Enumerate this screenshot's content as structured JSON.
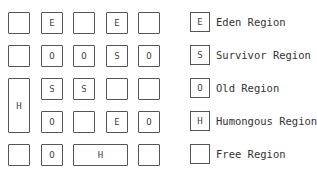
{
  "grid": {
    "cells": [
      {
        "row": 0,
        "col": 0,
        "span": 1,
        "rowspan": 1,
        "label": ""
      },
      {
        "row": 0,
        "col": 1,
        "span": 1,
        "rowspan": 1,
        "label": "E"
      },
      {
        "row": 0,
        "col": 2,
        "span": 1,
        "rowspan": 1,
        "label": ""
      },
      {
        "row": 0,
        "col": 3,
        "span": 1,
        "rowspan": 1,
        "label": "E"
      },
      {
        "row": 0,
        "col": 4,
        "span": 1,
        "rowspan": 1,
        "label": ""
      },
      {
        "row": 1,
        "col": 0,
        "span": 1,
        "rowspan": 1,
        "label": ""
      },
      {
        "row": 1,
        "col": 1,
        "span": 1,
        "rowspan": 1,
        "label": "O"
      },
      {
        "row": 1,
        "col": 2,
        "span": 1,
        "rowspan": 1,
        "label": "O"
      },
      {
        "row": 1,
        "col": 3,
        "span": 1,
        "rowspan": 1,
        "label": "S"
      },
      {
        "row": 1,
        "col": 4,
        "span": 1,
        "rowspan": 1,
        "label": "O"
      },
      {
        "row": 2,
        "col": 0,
        "span": 1,
        "rowspan": 2,
        "label": "H"
      },
      {
        "row": 2,
        "col": 1,
        "span": 1,
        "rowspan": 1,
        "label": "S"
      },
      {
        "row": 2,
        "col": 2,
        "span": 1,
        "rowspan": 1,
        "label": "S"
      },
      {
        "row": 2,
        "col": 3,
        "span": 1,
        "rowspan": 1,
        "label": ""
      },
      {
        "row": 2,
        "col": 4,
        "span": 1,
        "rowspan": 1,
        "label": ""
      },
      {
        "row": 3,
        "col": 1,
        "span": 1,
        "rowspan": 1,
        "label": "O"
      },
      {
        "row": 3,
        "col": 2,
        "span": 1,
        "rowspan": 1,
        "label": ""
      },
      {
        "row": 3,
        "col": 3,
        "span": 1,
        "rowspan": 1,
        "label": "E"
      },
      {
        "row": 3,
        "col": 4,
        "span": 1,
        "rowspan": 1,
        "label": "O"
      },
      {
        "row": 4,
        "col": 0,
        "span": 1,
        "rowspan": 1,
        "label": ""
      },
      {
        "row": 4,
        "col": 1,
        "span": 1,
        "rowspan": 1,
        "label": "O"
      },
      {
        "row": 4,
        "col": 2,
        "span": 2,
        "rowspan": 1,
        "label": "H"
      },
      {
        "row": 4,
        "col": 4,
        "span": 1,
        "rowspan": 1,
        "label": ""
      }
    ]
  },
  "legend": [
    {
      "symbol": "E",
      "label": "Eden Region"
    },
    {
      "symbol": "S",
      "label": "Survivor Region"
    },
    {
      "symbol": "O",
      "label": "Old Region"
    },
    {
      "symbol": "H",
      "label": "Humongous Region"
    },
    {
      "symbol": "",
      "label": "Free Region"
    }
  ]
}
